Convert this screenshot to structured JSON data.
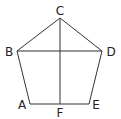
{
  "diagram": {
    "type": "pentagon-geometry",
    "stroke_color": "#333333",
    "label_color": "#222222",
    "points": {
      "A": {
        "label": "A",
        "x": 30,
        "y": 104
      },
      "B": {
        "label": "B",
        "x": 17,
        "y": 51
      },
      "C": {
        "label": "C",
        "x": 60,
        "y": 18
      },
      "D": {
        "label": "D",
        "x": 102,
        "y": 51
      },
      "E": {
        "label": "E",
        "x": 89,
        "y": 104
      },
      "F": {
        "label": "F",
        "x": 60,
        "y": 104
      }
    },
    "segments": [
      [
        "A",
        "B"
      ],
      [
        "B",
        "C"
      ],
      [
        "C",
        "D"
      ],
      [
        "D",
        "E"
      ],
      [
        "E",
        "A"
      ],
      [
        "B",
        "D"
      ],
      [
        "C",
        "F"
      ]
    ],
    "labels": {
      "A": "A",
      "B": "B",
      "C": "C",
      "D": "D",
      "E": "E",
      "F": "F"
    }
  }
}
